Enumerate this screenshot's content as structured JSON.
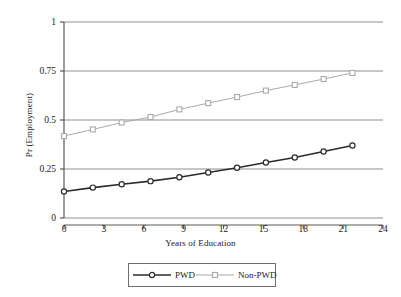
{
  "chart_data": {
    "type": "line",
    "title": "",
    "xlabel": "Years of Education",
    "ylabel": "Pr (Employment)",
    "xlim": [
      0,
      24
    ],
    "ylim": [
      0,
      1
    ],
    "xticks": [
      0,
      3,
      6,
      9,
      12,
      15,
      18,
      21,
      24
    ],
    "xticklabels": [
      "0",
      "3",
      "6",
      "9",
      "12",
      "15",
      "18",
      "21",
      "24"
    ],
    "yticks": [
      0,
      0.25,
      0.5,
      0.75,
      1
    ],
    "yticklabels": [
      "0",
      "0.25",
      "0.5",
      "0.75",
      "1"
    ],
    "grid": "horizontal",
    "legend_position": "below-outside",
    "x": [
      0,
      2.17,
      4.34,
      6.51,
      8.68,
      10.85,
      13.02,
      15.19,
      17.36,
      19.53,
      21.7
    ],
    "series": [
      {
        "name": "PWD",
        "marker": "circle",
        "color": "#2b2b2b",
        "line_width": 1.6,
        "values": [
          0.135,
          0.155,
          0.172,
          0.188,
          0.208,
          0.232,
          0.256,
          0.283,
          0.309,
          0.339,
          0.37
        ]
      },
      {
        "name": "Non-PWD",
        "marker": "square",
        "color": "#aaaaaa",
        "line_width": 1.0,
        "values": [
          0.418,
          0.452,
          0.487,
          0.515,
          0.554,
          0.586,
          0.617,
          0.65,
          0.679,
          0.709,
          0.74
        ]
      }
    ]
  },
  "legend": {
    "items": [
      {
        "label": "PWD"
      },
      {
        "label": "Non-PWD"
      }
    ]
  },
  "colors": {
    "pwd": "#2b2b2b",
    "non_pwd": "#aaaaaa",
    "grid": "#8f8f8f",
    "axis": "#5a5a5a",
    "background": "#ffffff"
  }
}
